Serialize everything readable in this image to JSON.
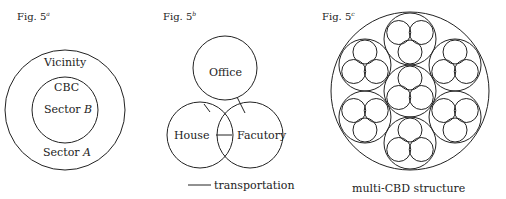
{
  "figures": [
    {
      "id": "a",
      "title": "Fig. 5",
      "superscript": "a",
      "labels": {
        "outer": "Vicinity",
        "inner_top": "CBC",
        "inner": "Sector B",
        "inner_var": "B",
        "inner_word": "Sector",
        "outer_bottom_word": "Sector",
        "outer_bottom_var": "A"
      }
    },
    {
      "id": "b",
      "title": "Fig. 5",
      "superscript": "b",
      "labels": {
        "top": "Office",
        "left": "House",
        "right": "Facutory"
      },
      "legend": "transportation"
    },
    {
      "id": "c",
      "title": "Fig. 5",
      "superscript": "c",
      "caption": "multi-CBD structure"
    }
  ]
}
